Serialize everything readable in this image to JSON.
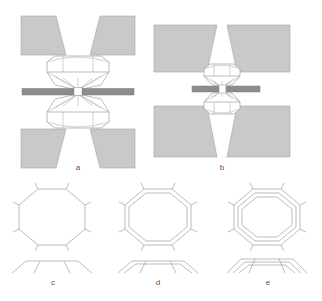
{
  "figure": {
    "width": 322,
    "height": 301,
    "background": "#ffffff"
  },
  "colors": {
    "wedge_fill": "#c9c9c9",
    "wedge_stroke": "#9a9a9a",
    "bar_fill": "#8c8c8c",
    "bar_stroke": "#7a7a7a",
    "body_stroke": "#9e9e9e",
    "body_fill": "#ffffff",
    "thin_stroke": "#b0b0b0",
    "label_color": "#555555",
    "gap_fill": "#ffffff"
  },
  "panels": [
    {
      "id": "a",
      "label": "a",
      "label_x": 78,
      "label_y": 168,
      "type": "side-view-narrow",
      "description": "Narrow-angle hourglass assembly: two mirrored octagonal drums with converging cones meeting at a central dark horizontal bar; four gray wedges fan outward at steep angles",
      "center_x": 78,
      "center_y": 92,
      "wedge_count": 4,
      "wedge_spread": "narrow",
      "drum_count": 2,
      "bar": {
        "x": 22,
        "y": 88,
        "width": 112,
        "height": 7,
        "gap_width": 8
      }
    },
    {
      "id": "b",
      "label": "b",
      "label_x": 222,
      "label_y": 168,
      "type": "side-view-wide",
      "description": "Wide-angle hourglass assembly: compact mirrored drums at a central dark horizontal bar; four large gray wedges fan outward at shallow angles",
      "center_x": 222,
      "center_y": 90,
      "wedge_count": 4,
      "wedge_spread": "wide",
      "drum_count": 2,
      "bar": {
        "x": 192,
        "y": 86,
        "width": 68,
        "height": 6,
        "gap_width": 7
      }
    },
    {
      "id": "c",
      "label": "c",
      "label_x": 52,
      "label_y": 283,
      "type": "top-view-octagon",
      "description": "Single octagonal ring, top view with radial tick marks at each vertex, plus side profile below",
      "ring_count": 1,
      "vertex_count": 8,
      "center_x": 52,
      "center_y": 217,
      "radius": 33,
      "profile_lines": 1
    },
    {
      "id": "d",
      "label": "d",
      "label_x": 158,
      "label_y": 283,
      "type": "top-view-octagon",
      "description": "Double nested octagonal rings, top view with radial tick marks at each vertex, plus side profile below",
      "ring_count": 2,
      "vertex_count": 8,
      "center_x": 158,
      "center_y": 217,
      "radius": 33,
      "profile_lines": 2
    },
    {
      "id": "e",
      "label": "e",
      "label_x": 267,
      "label_y": 283,
      "type": "top-view-octagon",
      "description": "Triple nested octagonal rings, top view with radial tick marks at each vertex, plus side profile below",
      "ring_count": 3,
      "vertex_count": 8,
      "center_x": 267,
      "center_y": 217,
      "radius": 33,
      "profile_lines": 3
    }
  ]
}
